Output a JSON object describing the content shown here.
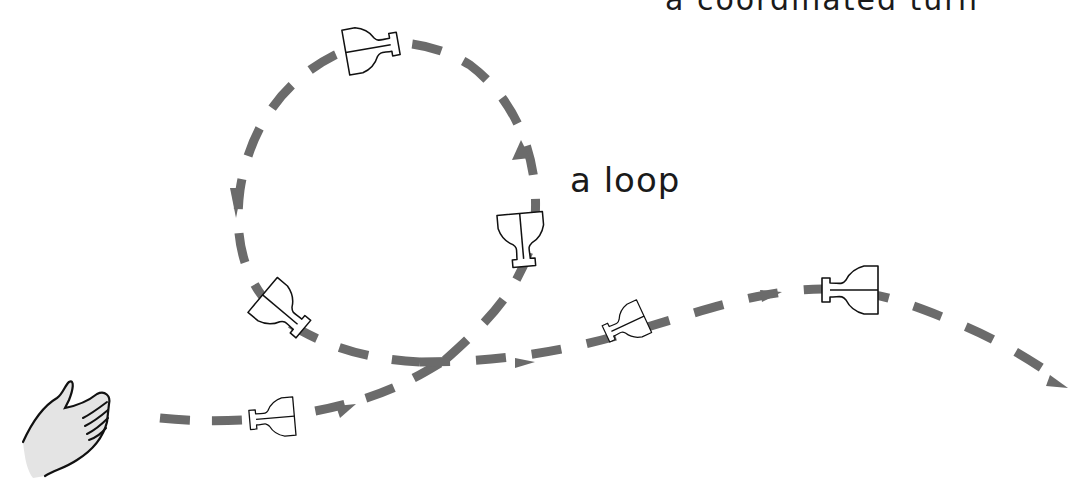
{
  "diagram": {
    "labels": {
      "loop": "a loop",
      "top_cut": "a coordinated turn"
    },
    "colors": {
      "path": "#6b6b6b",
      "outline": "#111111",
      "hand_fill": "#e4e4e4",
      "background": "#ffffff"
    },
    "elements": {
      "hand": "launching-hand",
      "flight_path": "dashed flight path with arrows",
      "aircraft_count": 7
    }
  }
}
